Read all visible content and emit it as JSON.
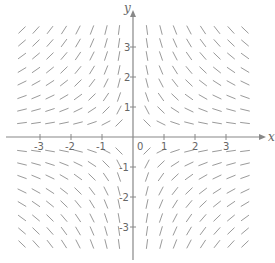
{
  "chart_data": {
    "type": "slope-field",
    "title": "",
    "equation": "dy/dx = -y/x",
    "xlabel": "x",
    "ylabel": "y",
    "xlim": [
      -4,
      4
    ],
    "ylim": [
      -4,
      4
    ],
    "x_ticks": [
      -3,
      -2,
      -1,
      1,
      2,
      3
    ],
    "y_ticks": [
      -3,
      -2,
      -1,
      1,
      2,
      3
    ],
    "x_tick_labels": [
      "-3",
      "-2",
      "-1",
      "1",
      "2",
      "3"
    ],
    "y_tick_labels": [
      "-3",
      "-2",
      "-1",
      "1",
      "2",
      "3"
    ],
    "origin_label": "0",
    "grid": false,
    "grid_x_px": [
      22,
      36,
      50,
      64,
      78,
      92,
      106,
      119,
      147,
      161,
      175,
      189,
      203,
      217,
      231,
      245
    ],
    "grid_y_px": [
      30,
      43,
      56,
      70,
      83,
      97,
      110,
      123,
      151,
      164,
      177,
      191,
      204,
      218,
      231,
      244
    ],
    "segment_length_px": 9,
    "colors": {
      "axis": "#888888",
      "segment": "#9a9a9a",
      "text": "#666666"
    }
  },
  "layout": {
    "origin_px": [
      133,
      137
    ],
    "unit_x_px": 31,
    "unit_y_px": 30
  }
}
